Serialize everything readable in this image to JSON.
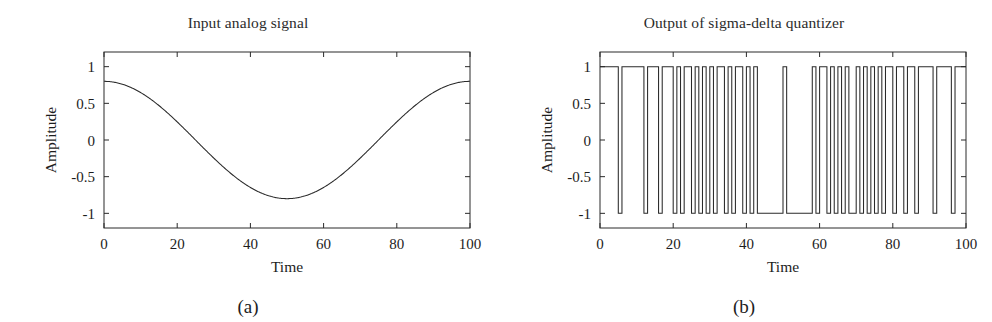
{
  "figure": {
    "panels": [
      {
        "id": "panel-a",
        "title": "Input analog signal",
        "sublabel": "(a)"
      },
      {
        "id": "panel-b",
        "title": "Output of sigma-delta quantizer",
        "sublabel": "(b)"
      }
    ]
  },
  "chart_data": [
    {
      "type": "line",
      "id": "input-analog-signal",
      "title": "Input analog signal",
      "sublabel": "(a)",
      "xlabel": "Time",
      "ylabel": "Amplitude",
      "xlim": [
        0,
        100
      ],
      "ylim": [
        -1.2,
        1.2
      ],
      "xticks": [
        0,
        20,
        40,
        60,
        80,
        100
      ],
      "xticklabels": [
        "0",
        "20",
        "40",
        "60",
        "80",
        "100"
      ],
      "yticks": [
        -1,
        -0.5,
        0,
        0.5,
        1
      ],
      "yticklabels": [
        "-1",
        "-0.5",
        "0",
        "0.5",
        "1"
      ],
      "grid": false,
      "legend": false,
      "line_color": "#2a2a2a",
      "description": "Sinusoid, amplitude 0.8, one full period over 0..100, starting at +0.8 and reaching minimum -0.8 near Time = 50",
      "series": [
        {
          "name": "analog input",
          "formula": "y = 0.8 * cos(2*pi*x/100)",
          "amplitude": 0.8,
          "period": 100,
          "phase": 0,
          "x": [
            0,
            5,
            10,
            15,
            20,
            25,
            30,
            35,
            40,
            45,
            50,
            55,
            60,
            65,
            70,
            75,
            80,
            85,
            90,
            95,
            100
          ],
          "values": [
            0.8,
            0.76,
            0.647,
            0.47,
            0.247,
            0.0,
            -0.247,
            -0.47,
            -0.647,
            -0.76,
            -0.8,
            -0.76,
            -0.647,
            -0.47,
            -0.247,
            0.0,
            0.247,
            0.47,
            0.647,
            0.76,
            0.8
          ]
        }
      ]
    },
    {
      "type": "line",
      "id": "sigma-delta-output",
      "title": "Output of sigma-delta quantizer",
      "sublabel": "(b)",
      "xlabel": "Time",
      "ylabel": "Amplitude",
      "xlim": [
        0,
        100
      ],
      "ylim": [
        -1.2,
        1.2
      ],
      "xticks": [
        0,
        20,
        40,
        60,
        80,
        100
      ],
      "xticklabels": [
        "0",
        "20",
        "40",
        "60",
        "80",
        "100"
      ],
      "yticks": [
        -1,
        -0.5,
        0,
        0.5,
        1
      ],
      "yticklabels": [
        "-1",
        "-0.5",
        "0",
        "0.5",
        "1"
      ],
      "grid": false,
      "legend": false,
      "line_color": "#2a2a2a",
      "description": "Two-level (+1 / -1) bitstream from a sigma-delta modulator; density of -1 pulses is highest near Time = 45-52 where the input is most negative, and lowest near the ends where the input is most positive",
      "series": [
        {
          "name": "quantizer output",
          "levels": [
            1,
            -1
          ],
          "x": [
            0,
            1,
            2,
            3,
            4,
            5,
            6,
            7,
            8,
            9,
            10,
            11,
            12,
            13,
            14,
            15,
            16,
            17,
            18,
            19,
            20,
            21,
            22,
            23,
            24,
            25,
            26,
            27,
            28,
            29,
            30,
            31,
            32,
            33,
            34,
            35,
            36,
            37,
            38,
            39,
            40,
            41,
            42,
            43,
            44,
            45,
            46,
            47,
            48,
            49,
            50,
            51,
            52,
            53,
            54,
            55,
            56,
            57,
            58,
            59,
            60,
            61,
            62,
            63,
            64,
            65,
            66,
            67,
            68,
            69,
            70,
            71,
            72,
            73,
            74,
            75,
            76,
            77,
            78,
            79,
            80,
            81,
            82,
            83,
            84,
            85,
            86,
            87,
            88,
            89,
            90,
            91,
            92,
            93,
            94,
            95,
            96,
            97,
            98,
            99
          ],
          "values": [
            1,
            1,
            1,
            1,
            1,
            -1,
            1,
            1,
            1,
            1,
            1,
            1,
            -1,
            1,
            1,
            1,
            -1,
            1,
            1,
            1,
            -1,
            1,
            -1,
            1,
            1,
            -1,
            1,
            -1,
            1,
            -1,
            1,
            -1,
            1,
            1,
            -1,
            1,
            -1,
            1,
            1,
            -1,
            1,
            -1,
            1,
            -1,
            -1,
            -1,
            -1,
            -1,
            -1,
            -1,
            1,
            -1,
            -1,
            -1,
            -1,
            -1,
            -1,
            -1,
            1,
            -1,
            1,
            1,
            -1,
            1,
            -1,
            1,
            -1,
            1,
            -1,
            -1,
            1,
            -1,
            1,
            -1,
            1,
            -1,
            1,
            -1,
            1,
            1,
            -1,
            1,
            1,
            -1,
            1,
            1,
            -1,
            1,
            1,
            1,
            1,
            -1,
            1,
            1,
            1,
            1,
            -1,
            1,
            1,
            1
          ]
        }
      ]
    }
  ]
}
